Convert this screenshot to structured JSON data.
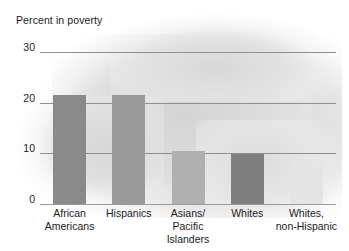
{
  "chart_data": {
    "type": "bar",
    "title": "Percent in poverty",
    "xlabel": "",
    "ylabel": "Percent in poverty",
    "categories": [
      "African\nAmericans",
      "Hispanics",
      "Asians/\nPacific Islanders",
      "Whites",
      "Whites,\nnon-Hispanic"
    ],
    "values": [
      21.6,
      21.5,
      10.5,
      9.9,
      8.2
    ],
    "ylim": [
      0,
      30
    ],
    "yticks": [
      0,
      10,
      20,
      30
    ],
    "ytick_labels": [
      "0",
      "10",
      "20",
      "30"
    ],
    "grid": "horizontal",
    "legend": "none",
    "bar_colors": [
      "#8a8a8a",
      "#9a9a9a",
      "#b0b0b0",
      "#7f7f7f",
      "#e4e4e4"
    ]
  },
  "colors": {
    "gridline": "#8f8f8f",
    "text": "#1c1c1c",
    "background": "#ffffff",
    "plot_shading": "#dcdcdc"
  }
}
